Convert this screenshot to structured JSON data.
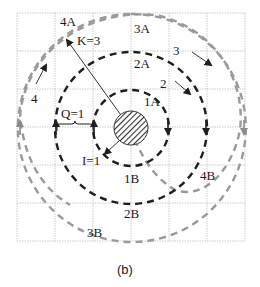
{
  "figure": {
    "caption": "(b)",
    "grid": {
      "rows": 6,
      "cols": 6,
      "color": "#b8b8b8"
    },
    "colors": {
      "dark_path": "#1e1e1e",
      "gray_path": "#9a9a9a",
      "hatch": "#333333"
    },
    "labels": {
      "k": "K=3",
      "q": "Q=1",
      "i": "I=1",
      "p1": "1",
      "p2": "2",
      "p3": "3",
      "p4": "4",
      "a1": "1A",
      "a2": "2A",
      "a3": "3A",
      "a4": "4A",
      "b1": "1B",
      "b2": "2B",
      "b3": "3B",
      "b4": "4B"
    }
  }
}
